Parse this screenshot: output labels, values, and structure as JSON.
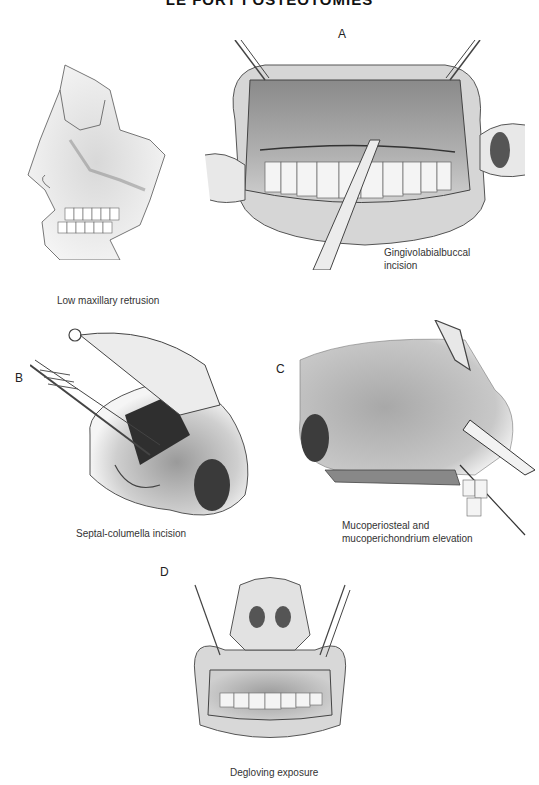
{
  "page": {
    "header": "LE FORT I OSTEOTOMIES"
  },
  "figures": [
    {
      "id": "skull",
      "letter": "",
      "caption": "Low maxillary retrusion"
    },
    {
      "id": "A",
      "letter": "A",
      "caption": "Gingivolabialbuccal incision",
      "caption_lines": [
        "Gingivolabialbuccal",
        "incision"
      ]
    },
    {
      "id": "B",
      "letter": "B",
      "caption": "Septal-columella incision"
    },
    {
      "id": "C",
      "letter": "C",
      "caption": "Mucoperiosteal and mucoperichondrium elevation",
      "caption_lines": [
        "Mucoperiosteal and",
        "mucoperichondrium elevation"
      ]
    },
    {
      "id": "D",
      "letter": "D",
      "caption": "Degloving exposure"
    }
  ]
}
